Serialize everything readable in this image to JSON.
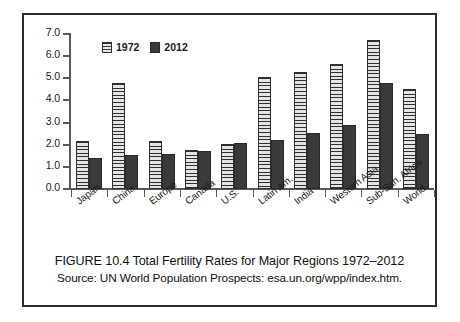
{
  "figure": {
    "caption_title": "FIGURE 10.4 Total Fertility Rates for Major Regions 1972–2012",
    "caption_source": "Source: UN World Population Prospects: esa.un.org/wpp/index.htm.",
    "border_color": "#2b2b2b",
    "background": "#ffffff"
  },
  "legend": {
    "position": "top-left-inside",
    "items": [
      {
        "label": "1972",
        "swatch": "hatched-horizontal-light",
        "color": "#d8d8d8"
      },
      {
        "label": "2012",
        "swatch": "solid-dark",
        "color": "#3a3a3a"
      }
    ]
  },
  "chart_data": {
    "type": "bar",
    "title": "FIGURE 10.4 Total Fertility Rates for Major Regions 1972–2012",
    "subtitle": "Source: UN World Population Prospects: esa.un.org/wpp/index.htm.",
    "xlabel": "",
    "ylabel": "",
    "ylim": [
      0.0,
      7.0
    ],
    "ytick_labels": [
      "0.0",
      "1.0",
      "2.0",
      "3.0",
      "4.0",
      "5.0",
      "6.0",
      "7.0"
    ],
    "ytick_values": [
      0.0,
      1.0,
      2.0,
      3.0,
      4.0,
      5.0,
      6.0,
      7.0
    ],
    "grid": false,
    "categories": [
      "Japan",
      "China",
      "Europe",
      "Canada",
      "U.S.",
      "Latin Am.",
      "India",
      "Western Asia",
      "Sub-Sah. Africa",
      "World"
    ],
    "series": [
      {
        "name": "1972",
        "values": [
          2.15,
          4.8,
          2.18,
          1.75,
          2.05,
          5.05,
          5.3,
          5.65,
          6.75,
          4.5
        ]
      },
      {
        "name": "2012",
        "values": [
          1.4,
          1.55,
          1.6,
          1.7,
          2.1,
          2.2,
          2.55,
          2.9,
          4.8,
          2.5
        ]
      }
    ]
  }
}
